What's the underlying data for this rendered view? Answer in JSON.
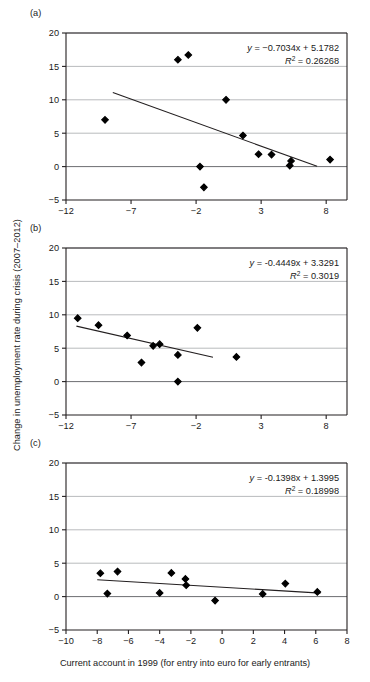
{
  "figure": {
    "ylabel": "Change in unemployment rate during crisis (2007–2012)",
    "xlabel": "Current account in 1999 (for entry into euro for early entrants)"
  },
  "chart_data": [
    {
      "type": "scatter",
      "panel": "(a)",
      "title": "",
      "xlabel": "",
      "ylabel": "",
      "xlim": [
        -12,
        9.6
      ],
      "ylim": [
        -5,
        20
      ],
      "xticks": [
        -12,
        -7,
        -2,
        3,
        8
      ],
      "yticks": [
        -5,
        0,
        5,
        10,
        15,
        20
      ],
      "xticklabels": [
        "-12",
        "-7",
        "-2",
        "3",
        "8"
      ],
      "yticklabels": [
        "-5",
        "0",
        "5",
        "10",
        "15",
        "20"
      ],
      "grid": "horizontal",
      "legend": "none",
      "equation": "y = −0.7034x + 5.1782",
      "r2": "R² = 0.26268",
      "slope": -0.7034,
      "intercept": 5.1782,
      "fit_x_range": [
        -8.4,
        7.3
      ],
      "points": [
        {
          "x": -9.0,
          "y": 7.0
        },
        {
          "x": -3.4,
          "y": 16.0
        },
        {
          "x": -2.6,
          "y": 16.7
        },
        {
          "x": -1.7,
          "y": 0.0
        },
        {
          "x": -1.4,
          "y": -3.1
        },
        {
          "x": 0.3,
          "y": 10.0
        },
        {
          "x": 1.6,
          "y": 4.65
        },
        {
          "x": 2.8,
          "y": 1.85
        },
        {
          "x": 3.8,
          "y": 1.8
        },
        {
          "x": 5.3,
          "y": 0.85
        },
        {
          "x": 5.2,
          "y": 0.15
        },
        {
          "x": 8.3,
          "y": 1.05
        }
      ]
    },
    {
      "type": "scatter",
      "panel": "(b)",
      "title": "",
      "xlabel": "",
      "ylabel": "",
      "xlim": [
        -12,
        9.6
      ],
      "ylim": [
        -5,
        20
      ],
      "xticks": [
        -12,
        -7,
        -2,
        3,
        8
      ],
      "yticks": [
        -5,
        0,
        5,
        10,
        15,
        20
      ],
      "xticklabels": [
        "-12",
        "-7",
        "-2",
        "3",
        "8"
      ],
      "yticklabels": [
        "-5",
        "0",
        "5",
        "10",
        "15",
        "20"
      ],
      "grid": "horizontal",
      "legend": "none",
      "equation": "y = -0.4449x + 3.3291",
      "r2": "R² = 0.3019",
      "slope": -0.4449,
      "intercept": 3.3291,
      "fit_x_range": [
        -11.2,
        -0.7
      ],
      "points": [
        {
          "x": -11.1,
          "y": 9.5
        },
        {
          "x": -9.5,
          "y": 8.45
        },
        {
          "x": -7.3,
          "y": 6.9
        },
        {
          "x": -6.2,
          "y": 2.85
        },
        {
          "x": -5.3,
          "y": 5.35
        },
        {
          "x": -4.8,
          "y": 5.6
        },
        {
          "x": -3.4,
          "y": 4.0
        },
        {
          "x": -3.4,
          "y": 0.0
        },
        {
          "x": -1.9,
          "y": 8.05
        },
        {
          "x": 1.1,
          "y": 3.7
        }
      ]
    },
    {
      "type": "scatter",
      "panel": "(c)",
      "title": "",
      "xlabel": "",
      "ylabel": "",
      "xlim": [
        -10,
        8
      ],
      "ylim": [
        -5,
        20
      ],
      "xticks": [
        -10,
        -8,
        -6,
        -4,
        -2,
        0,
        2,
        4,
        6,
        8
      ],
      "yticks": [
        -5,
        0,
        5,
        10,
        15,
        20
      ],
      "xticklabels": [
        "-10",
        "-8",
        "-6",
        "-4",
        "-2",
        "0",
        "2",
        "4",
        "6",
        "8"
      ],
      "yticklabels": [
        "-5",
        "0",
        "5",
        "10",
        "15",
        "20"
      ],
      "grid": "horizontal",
      "legend": "none",
      "equation": "y = -0.1398x + 1.3995",
      "r2": "R² = 0.18998",
      "slope": -0.1398,
      "intercept": 1.3995,
      "fit_x_range": [
        -8.0,
        6.3
      ],
      "points": [
        {
          "x": -7.8,
          "y": 3.5
        },
        {
          "x": -7.35,
          "y": 0.45
        },
        {
          "x": -6.7,
          "y": 3.75
        },
        {
          "x": -4.0,
          "y": 0.55
        },
        {
          "x": -3.25,
          "y": 3.55
        },
        {
          "x": -2.35,
          "y": 2.65
        },
        {
          "x": -2.3,
          "y": 1.7
        },
        {
          "x": -0.45,
          "y": -0.6
        },
        {
          "x": 2.6,
          "y": 0.4
        },
        {
          "x": 4.05,
          "y": 1.95
        },
        {
          "x": 6.1,
          "y": 0.7
        }
      ]
    }
  ],
  "colors": {
    "axis": "#231f20",
    "grid": "#a7a9ac",
    "marker": "#000000",
    "fitline": "#231f20",
    "text": "#1a1a1a"
  }
}
